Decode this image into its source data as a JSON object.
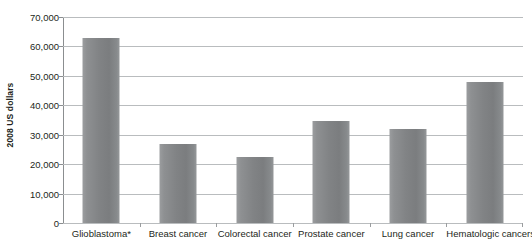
{
  "chart_data": {
    "type": "bar",
    "title": "",
    "subtitle": "",
    "xlabel": "",
    "ylabel": "2008 US dollars",
    "categories": [
      "Glioblastoma*",
      "Breast cancer",
      "Colorectal cancer",
      "Prostate cancer",
      "Lung cancer",
      "Hematologic cancers"
    ],
    "values": [
      63000,
      27000,
      22500,
      34500,
      32000,
      48000
    ],
    "ylim": [
      0,
      70000
    ],
    "y_ticks": [
      0,
      10000,
      20000,
      30000,
      40000,
      50000,
      60000,
      70000
    ],
    "y_tick_labels": [
      "0",
      "10,000",
      "20,000",
      "30,000",
      "40,000",
      "50,000",
      "60,000",
      "70,000"
    ],
    "grid": true,
    "grid_axis": "y",
    "legend": null,
    "legend_position": "none",
    "annotations": [
      "* asterisk footnote marker on Glioblastoma category"
    ],
    "colors": {
      "bar_fill_light": "#9b9d9f",
      "bar_fill_dark": "#7b7d7f",
      "gridline": "#b9bcbe",
      "axis_line": "#8b8e90",
      "text": "#231f20",
      "background": "#ffffff"
    }
  }
}
